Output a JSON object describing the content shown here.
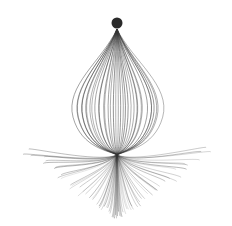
{
  "artwork": {
    "description": "Abstract line-art: onion/bulb shape of curved strands hanging from a dot, with a root-like fan of strands below",
    "background_color": "#ffffff",
    "stroke_color": "#333333",
    "dot": {
      "cx": 117,
      "cy": 23,
      "r": 5.5,
      "color": "#2a2a2a"
    },
    "bulb": {
      "top_x": 117,
      "top_y": 29,
      "bottom_x": 117,
      "bottom_y": 155,
      "half_width": 43,
      "strand_count": 36
    },
    "roots": {
      "origin_x": 117,
      "origin_y": 155,
      "strand_count": 70,
      "left_extent": 18,
      "right_extent": 216,
      "max_depth": 215
    }
  }
}
